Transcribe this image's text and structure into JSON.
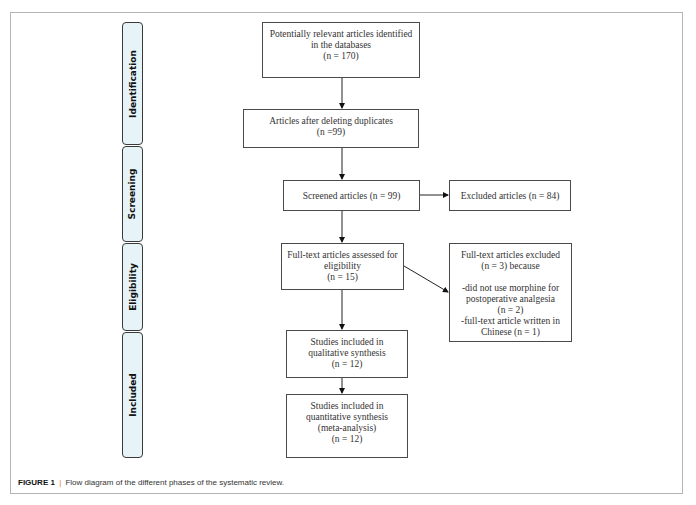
{
  "phases": [
    {
      "label": "Identification"
    },
    {
      "label": "Screening"
    },
    {
      "label": "Eligibility"
    },
    {
      "label": "Included"
    }
  ],
  "boxes": {
    "identified": {
      "lines": [
        "Potentially relevant articles identified",
        "in the databases",
        "(n = 170)"
      ]
    },
    "deduplicated": {
      "lines": [
        "Articles after deleting duplicates",
        "(n =99)"
      ]
    },
    "screened": {
      "lines": [
        "Screened articles (n = 99)"
      ]
    },
    "excluded": {
      "lines": [
        "Excluded articles (n = 84)"
      ]
    },
    "fulltext_assessed": {
      "lines": [
        "Full-text articles assessed for",
        "eligibility",
        "(n = 15)"
      ]
    },
    "fulltext_excluded": {
      "lines": [
        "Full-text articles excluded",
        "(n = 3) because",
        "",
        "-did not use morphine for",
        "postoperative analgesia",
        "(n = 2)",
        "-full-text article written in",
        "Chinese (n = 1)"
      ]
    },
    "qualitative": {
      "lines": [
        "Studies included in",
        "qualitative synthesis",
        "(n = 12)"
      ]
    },
    "quantitative": {
      "lines": [
        "Studies included in",
        "quantitative synthesis",
        "(meta-analysis)",
        "(n = 12)"
      ]
    }
  },
  "caption": {
    "label": "FIGURE 1",
    "separator": "|",
    "text": "Flow diagram of the different phases of the systematic review."
  },
  "colors": {
    "phase_fill": "#e6f3f7",
    "caption_separator": "#e07a1a"
  }
}
